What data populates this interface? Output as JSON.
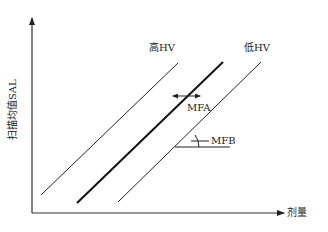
{
  "diagram": {
    "axes": {
      "y_label": "扫描均值SAL",
      "x_label": "剂量"
    },
    "lines": [
      {
        "label": "高HV",
        "style": "thin"
      },
      {
        "label": "",
        "style": "thick"
      },
      {
        "label": "低HV",
        "style": "thin"
      }
    ],
    "annotations": {
      "mfa": "MFA",
      "mfb": "MFB"
    },
    "colors": {
      "ink": "#222222",
      "background": "#ffffff"
    }
  }
}
